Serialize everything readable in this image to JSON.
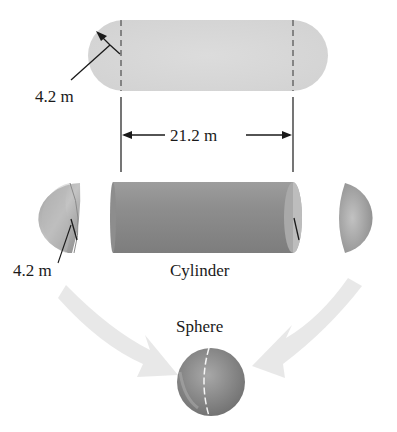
{
  "diagram": {
    "capsule": {
      "radius_label": "4.2 m",
      "length_label": "21.2 m",
      "fill_color": "#d6d6d6"
    },
    "parts": {
      "cylinder_label": "Cylinder",
      "hemisphere_radius_label": "4.2 m",
      "cylinder_color": "#8c8c8c",
      "hemisphere_color": "#9a9a9a"
    },
    "result": {
      "sphere_label": "Sphere",
      "sphere_color": "#8a8a8a",
      "arrow_color": "#e6e6e6"
    }
  }
}
